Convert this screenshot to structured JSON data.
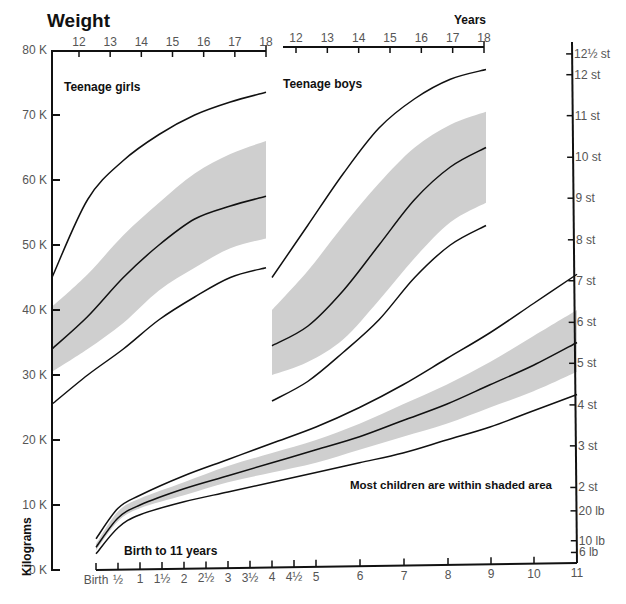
{
  "title": "Weight",
  "years_label": "Years",
  "y_axis_label": "Kilograms",
  "colors": {
    "band": "#cfcfcf",
    "line": "#111111",
    "axis": "#111111",
    "text": "#555555"
  },
  "left_axis": {
    "ticks": [
      {
        "label": "80 K",
        "kg": 80
      },
      {
        "label": "70 K",
        "kg": 70
      },
      {
        "label": "60 K",
        "kg": 60
      },
      {
        "label": "50 K",
        "kg": 50
      },
      {
        "label": "40 K",
        "kg": 40
      },
      {
        "label": "30 K",
        "kg": 30
      },
      {
        "label": "20 K",
        "kg": 20
      },
      {
        "label": "10 K",
        "kg": 10
      },
      {
        "label": "0 K",
        "kg": 0
      }
    ]
  },
  "right_axis": {
    "ticks": [
      {
        "label": "12½ st",
        "kg": 79.4
      },
      {
        "label": "12 st",
        "kg": 76.2
      },
      {
        "label": "11 st",
        "kg": 69.9
      },
      {
        "label": "10 st",
        "kg": 63.5
      },
      {
        "label": "9 st",
        "kg": 57.2
      },
      {
        "label": "8 st",
        "kg": 50.8
      },
      {
        "label": "7 st",
        "kg": 44.5
      },
      {
        "label": "6 st",
        "kg": 38.1
      },
      {
        "label": "5 st",
        "kg": 31.8
      },
      {
        "label": "4 st",
        "kg": 25.4
      },
      {
        "label": "3 st",
        "kg": 19.1
      },
      {
        "label": "2 st",
        "kg": 12.7
      },
      {
        "label": "20 lb",
        "kg": 9.1
      },
      {
        "label": "10 lb",
        "kg": 4.5
      },
      {
        "label": "6 lb",
        "kg": 2.7
      }
    ]
  },
  "girls_axis": {
    "ticks": [
      "12",
      "13",
      "14",
      "15",
      "16",
      "17",
      "18"
    ]
  },
  "boys_axis": {
    "ticks": [
      "12",
      "13",
      "14",
      "15",
      "16",
      "17",
      "18"
    ]
  },
  "bottom_axis": {
    "ticks": [
      "Birth",
      "½",
      "1",
      "1½",
      "2",
      "2½",
      "3",
      "3½",
      "4",
      "4½",
      "5",
      "6",
      "7",
      "8",
      "9",
      "10",
      "11"
    ]
  },
  "annotations": {
    "girls": "Teenage girls",
    "boys": "Teenage boys",
    "children": "Birth to 11 years",
    "shaded_note": "Most children are within shaded area"
  },
  "chart_data": [
    {
      "type": "line",
      "title": "Teenage girls",
      "xlabel": "Years",
      "ylabel": "Kilograms",
      "x": [
        12,
        13,
        14,
        15,
        16,
        17,
        18
      ],
      "ylim": [
        0,
        80
      ],
      "series": [
        {
          "name": "upper",
          "values": [
            45,
            57,
            63,
            67,
            70,
            72,
            73.5
          ]
        },
        {
          "name": "median",
          "values": [
            34,
            39,
            45,
            50,
            54,
            56,
            57.5
          ]
        },
        {
          "name": "lower",
          "values": [
            25.5,
            30,
            34,
            38.5,
            42,
            45,
            46.5
          ]
        },
        {
          "name": "shaded_upper",
          "values": [
            40.5,
            45.5,
            51.5,
            56.5,
            61,
            64,
            66
          ]
        },
        {
          "name": "shaded_lower",
          "values": [
            30.5,
            34,
            38,
            43,
            46.5,
            49.5,
            51
          ]
        }
      ]
    },
    {
      "type": "line",
      "title": "Teenage boys",
      "xlabel": "Years",
      "ylabel": "Kilograms",
      "x": [
        12,
        13,
        14,
        15,
        16,
        17,
        18
      ],
      "ylim": [
        0,
        80
      ],
      "series": [
        {
          "name": "upper",
          "values": [
            45,
            53,
            61,
            68,
            72.5,
            75.5,
            77
          ]
        },
        {
          "name": "median",
          "values": [
            34.5,
            37.5,
            43,
            50,
            57,
            62,
            65
          ]
        },
        {
          "name": "lower",
          "values": [
            26,
            29,
            33.5,
            38.5,
            45,
            50,
            53
          ]
        },
        {
          "name": "shaded_upper",
          "values": [
            40,
            46,
            53,
            59.5,
            65,
            68.5,
            70.5
          ]
        },
        {
          "name": "shaded_lower",
          "values": [
            30,
            32,
            35.5,
            41.5,
            48,
            53.5,
            56.5
          ]
        }
      ]
    },
    {
      "type": "line",
      "title": "Birth to 11 years",
      "xlabel": "Years",
      "ylabel": "Kilograms",
      "x": [
        0,
        0.5,
        1,
        2,
        3,
        4,
        5,
        6,
        7,
        8,
        9,
        10,
        11
      ],
      "ylim": [
        0,
        80
      ],
      "series": [
        {
          "name": "upper",
          "values": [
            4.8,
            9.5,
            11.5,
            14.5,
            17,
            19.5,
            22,
            25,
            28.5,
            32.5,
            36.5,
            41,
            45.5
          ]
        },
        {
          "name": "median",
          "values": [
            3.5,
            8,
            10,
            12.5,
            14.5,
            16.5,
            18.5,
            20.5,
            23,
            25.5,
            28.5,
            31.5,
            35
          ]
        },
        {
          "name": "lower",
          "values": [
            2.5,
            6.5,
            8.5,
            10.5,
            12,
            13.5,
            15,
            16.5,
            18,
            20,
            22,
            24.5,
            27
          ]
        },
        {
          "name": "shaded_upper",
          "values": [
            4,
            9,
            11,
            13.5,
            16,
            18,
            20,
            22.5,
            25.5,
            28.5,
            32,
            36,
            40
          ]
        },
        {
          "name": "shaded_lower",
          "values": [
            3,
            7.5,
            9.5,
            11.5,
            13.5,
            15,
            16.5,
            18.5,
            20.5,
            22.5,
            25,
            27.5,
            30.5
          ]
        }
      ]
    }
  ]
}
